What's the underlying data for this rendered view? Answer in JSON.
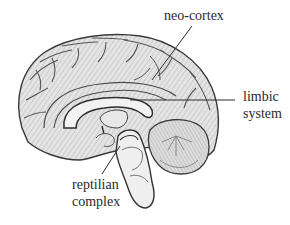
{
  "diagram": {
    "labels": [
      {
        "id": "neo-cortex",
        "lines": [
          "neo-cortex"
        ]
      },
      {
        "id": "limbic-system",
        "lines": [
          "limbic",
          "system"
        ]
      },
      {
        "id": "reptilian-complex",
        "lines": [
          "reptilian",
          "complex"
        ]
      }
    ],
    "colors": {
      "line": "#3a3a3a",
      "fill_light": "#eeeeee",
      "fill_mid": "#d6d6d6",
      "shade": "#9a9a9a",
      "background": "#ffffff",
      "text": "#2a2a2a"
    }
  }
}
